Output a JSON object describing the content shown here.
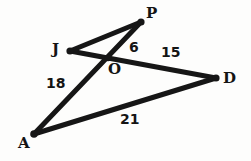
{
  "figure": {
    "type": "geometry-diagram",
    "background_color": "#fdfdfc",
    "stroke_color": "#161616",
    "width": 251,
    "height": 161,
    "vertices": [
      {
        "id": "P",
        "label": "P",
        "x": 141,
        "y": 22
      },
      {
        "id": "J",
        "label": "J",
        "x": 70,
        "y": 51
      },
      {
        "id": "O",
        "label": "O",
        "x": 108,
        "y": 58
      },
      {
        "id": "D",
        "label": "D",
        "x": 216,
        "y": 78
      },
      {
        "id": "A",
        "label": "A",
        "x": 34,
        "y": 134
      }
    ],
    "segments": [
      {
        "id": "JP",
        "from": "J",
        "to": "P"
      },
      {
        "id": "JD",
        "from": "J",
        "to": "D",
        "through": "O"
      },
      {
        "id": "PA",
        "from": "P",
        "to": "A",
        "through": "O"
      },
      {
        "id": "AD",
        "from": "A",
        "to": "D"
      }
    ],
    "measurements": [
      {
        "id": "OP",
        "value": "6",
        "segment": "OP",
        "x": 135,
        "y": 48
      },
      {
        "id": "OD",
        "value": "15",
        "segment": "OD",
        "x": 170,
        "y": 53
      },
      {
        "id": "AO",
        "value": "18",
        "segment": "AO",
        "x": 55,
        "y": 84
      },
      {
        "id": "AD",
        "value": "21",
        "segment": "AD",
        "x": 129,
        "y": 120
      }
    ]
  }
}
